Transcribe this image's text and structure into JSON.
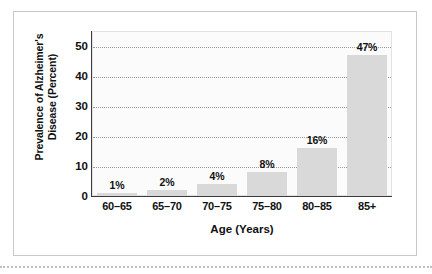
{
  "figure": {
    "frame_border_color": "#c9c9c9",
    "plot_background": "#fbfbfb",
    "bar_color": "#d9d9d9",
    "text_color": "#111111",
    "gridline_color": "#9a9a9a"
  },
  "chart_data": {
    "type": "bar",
    "title": "",
    "xlabel": "Age (Years)",
    "ylabel": "Prevalence of Alzheimer's Disease (Percent)",
    "ylabel_line1": "Prevalence of Alzheimer's",
    "ylabel_line2": "Disease (Percent)",
    "categories": [
      "60–65",
      "65–70",
      "70–75",
      "75–80",
      "80–85",
      "85+"
    ],
    "values": [
      1,
      2,
      4,
      8,
      16,
      47
    ],
    "value_labels": [
      "1%",
      "2%",
      "4%",
      "8%",
      "16%",
      "47%"
    ],
    "ylim": [
      0,
      55
    ],
    "yticks": [
      0,
      10,
      20,
      30,
      40,
      50
    ],
    "ytick_labels": [
      "0",
      "10",
      "20",
      "30",
      "40",
      "50"
    ],
    "grid": true,
    "grid_axis": "y",
    "grid_style": "dotted",
    "legend": false,
    "legend_position": "none"
  }
}
